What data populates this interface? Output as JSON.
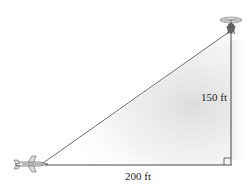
{
  "diagram": {
    "type": "right-triangle",
    "labels": {
      "vertical": "150 ft",
      "horizontal": "200 ft"
    },
    "objects": {
      "top_right": "helicopter",
      "bottom_left": "airplane"
    },
    "right_angle_marker": "bottom-right",
    "colors": {
      "line": "#333333",
      "shade": "#e6e6e6"
    }
  }
}
